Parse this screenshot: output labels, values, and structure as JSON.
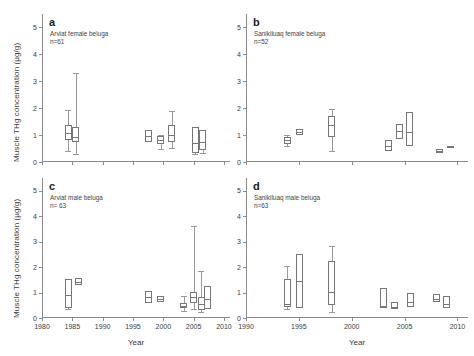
{
  "figure": {
    "ylabel": "Muscle THg concentration (µg/g)",
    "xlabel_left": "Year",
    "xlabel_right": "Year"
  },
  "panels": [
    {
      "letter": "a",
      "subtitle": "Arviat female beluga\nn=61",
      "xlim": [
        1980,
        2011
      ],
      "ylim": [
        0,
        5.5
      ],
      "xticks": [
        1980,
        1985,
        1990,
        1995,
        2000,
        2005,
        2010
      ],
      "yticks": [
        0,
        1,
        2,
        3,
        4,
        5
      ]
    },
    {
      "letter": "b",
      "subtitle": "Sanikiluaq female beluga\nn=52",
      "xlim": [
        1990,
        2011
      ],
      "ylim": [
        0,
        5.5
      ],
      "xticks": [
        1990,
        1995,
        2000,
        2005,
        2010
      ],
      "yticks": [
        0,
        1,
        2,
        3,
        4,
        5
      ]
    },
    {
      "letter": "c",
      "subtitle": "Arviat male beluga\nn= 63",
      "xlim": [
        1980,
        2011
      ],
      "ylim": [
        0,
        5.5
      ],
      "xticks": [
        1980,
        1985,
        1990,
        1995,
        2000,
        2005,
        2010
      ],
      "yticks": [
        0,
        1,
        2,
        3,
        4,
        5
      ]
    },
    {
      "letter": "d",
      "subtitle": "Sanikiluaq male beluga\nn=63",
      "xlim": [
        1990,
        2011
      ],
      "ylim": [
        0,
        5.5
      ],
      "xticks": [
        1990,
        1995,
        2000,
        2005,
        2010
      ],
      "yticks": [
        0,
        1,
        2,
        3,
        4,
        5
      ]
    }
  ],
  "chart_data": {
    "type": "box",
    "title": "",
    "ylabel": "Muscle THg concentration (µg/g)",
    "xlabel": "Year",
    "ylim": [
      0,
      5.5
    ],
    "grid": false,
    "legend": "none",
    "panels": [
      {
        "id": "a",
        "label": "Arviat female beluga",
        "n": 61,
        "xlim": [
          1980,
          2011
        ],
        "boxes": [
          {
            "year": 1984.3,
            "whislo": 0.42,
            "q1": 0.8,
            "med": 1.06,
            "q3": 1.38,
            "whishi": 1.95
          },
          {
            "year": 1985.6,
            "whislo": 0.3,
            "q1": 0.74,
            "med": 0.92,
            "q3": 1.3,
            "whishi": 3.3
          },
          {
            "year": 1997.5,
            "whislo": 0.72,
            "q1": 0.74,
            "med": 0.98,
            "q3": 1.18,
            "whishi": 1.2
          },
          {
            "year": 1999.6,
            "whislo": 0.48,
            "q1": 0.66,
            "med": 0.82,
            "q3": 0.96,
            "whishi": 1.02
          },
          {
            "year": 2001.4,
            "whislo": 0.52,
            "q1": 0.74,
            "med": 1.0,
            "q3": 1.36,
            "whishi": 1.88
          },
          {
            "year": 2005.3,
            "whislo": 0.28,
            "q1": 0.32,
            "med": 0.7,
            "q3": 1.3,
            "whishi": 1.32
          },
          {
            "year": 2006.5,
            "whislo": 0.34,
            "q1": 0.46,
            "med": 0.76,
            "q3": 1.18,
            "whishi": 1.2
          }
        ]
      },
      {
        "id": "b",
        "label": "Sanikiluaq female beluga",
        "n": 52,
        "xlim": [
          1990,
          2011
        ],
        "boxes": [
          {
            "year": 1993.9,
            "whislo": 0.58,
            "q1": 0.66,
            "med": 0.82,
            "q3": 0.94,
            "whishi": 1.0
          },
          {
            "year": 1995.1,
            "whislo": 1.0,
            "q1": 1.0,
            "med": 1.12,
            "q3": 1.22,
            "whishi": 1.22
          },
          {
            "year": 1998.1,
            "whislo": 0.42,
            "q1": 0.92,
            "med": 1.38,
            "q3": 1.72,
            "whishi": 1.96
          },
          {
            "year": 2003.5,
            "whislo": 0.4,
            "q1": 0.42,
            "med": 0.6,
            "q3": 0.8,
            "whishi": 0.82
          },
          {
            "year": 2004.5,
            "whislo": 0.84,
            "q1": 0.86,
            "med": 1.14,
            "q3": 1.4,
            "whishi": 1.42
          },
          {
            "year": 2005.5,
            "whislo": 0.56,
            "q1": 0.58,
            "med": 1.12,
            "q3": 1.86,
            "whishi": 1.88
          },
          {
            "year": 2008.3,
            "whislo": 0.3,
            "q1": 0.32,
            "med": 0.4,
            "q3": 0.48,
            "whishi": 0.5
          },
          {
            "year": 2009.3,
            "whislo": 0.56,
            "q1": 0.56,
            "med": 0.58,
            "q3": 0.6,
            "whishi": 0.6
          }
        ]
      },
      {
        "id": "c",
        "label": "Arviat male beluga",
        "n": 63,
        "xlim": [
          1980,
          2011
        ],
        "boxes": [
          {
            "year": 1984.3,
            "whislo": 0.34,
            "q1": 0.4,
            "med": 0.9,
            "q3": 1.54,
            "whishi": 1.56
          },
          {
            "year": 1986.0,
            "whislo": 1.26,
            "q1": 1.28,
            "med": 1.42,
            "q3": 1.56,
            "whishi": 1.58
          },
          {
            "year": 1997.5,
            "whislo": 0.58,
            "q1": 0.6,
            "med": 0.82,
            "q3": 1.06,
            "whishi": 1.08
          },
          {
            "year": 1999.6,
            "whislo": 0.62,
            "q1": 0.64,
            "med": 0.76,
            "q3": 0.88,
            "whishi": 0.9
          },
          {
            "year": 2003.4,
            "whislo": 0.26,
            "q1": 0.38,
            "med": 0.46,
            "q3": 0.58,
            "whishi": 0.88
          },
          {
            "year": 2005.0,
            "whislo": 0.36,
            "q1": 0.6,
            "med": 0.84,
            "q3": 1.02,
            "whishi": 3.62
          },
          {
            "year": 2006.3,
            "whislo": 0.22,
            "q1": 0.32,
            "med": 0.54,
            "q3": 0.82,
            "whishi": 1.86
          },
          {
            "year": 2007.3,
            "whislo": 0.34,
            "q1": 0.36,
            "med": 0.74,
            "q3": 1.26,
            "whishi": 1.28
          }
        ]
      },
      {
        "id": "d",
        "label": "Sanikiluaq male beluga",
        "n": 63,
        "xlim": [
          1990,
          2011
        ],
        "boxes": [
          {
            "year": 1993.9,
            "whislo": 0.34,
            "q1": 0.44,
            "med": 0.56,
            "q3": 1.52,
            "whishi": 2.04
          },
          {
            "year": 1995.1,
            "whislo": 0.38,
            "q1": 0.4,
            "med": 1.46,
            "q3": 2.52,
            "whishi": 2.54
          },
          {
            "year": 1998.1,
            "whislo": 0.24,
            "q1": 0.52,
            "med": 1.04,
            "q3": 2.24,
            "whishi": 2.84
          },
          {
            "year": 2003.0,
            "whislo": 0.38,
            "q1": 0.4,
            "med": 0.46,
            "q3": 1.18,
            "whishi": 1.2
          },
          {
            "year": 2004.0,
            "whislo": 0.34,
            "q1": 0.36,
            "med": 0.44,
            "q3": 0.62,
            "whishi": 0.64
          },
          {
            "year": 2005.6,
            "whislo": 0.42,
            "q1": 0.44,
            "med": 0.62,
            "q3": 1.0,
            "whishi": 1.02
          },
          {
            "year": 2008.0,
            "whislo": 0.62,
            "q1": 0.64,
            "med": 0.76,
            "q3": 0.94,
            "whishi": 0.96
          },
          {
            "year": 2009.0,
            "whislo": 0.38,
            "q1": 0.4,
            "med": 0.54,
            "q3": 0.86,
            "whishi": 0.88
          }
        ]
      }
    ]
  }
}
